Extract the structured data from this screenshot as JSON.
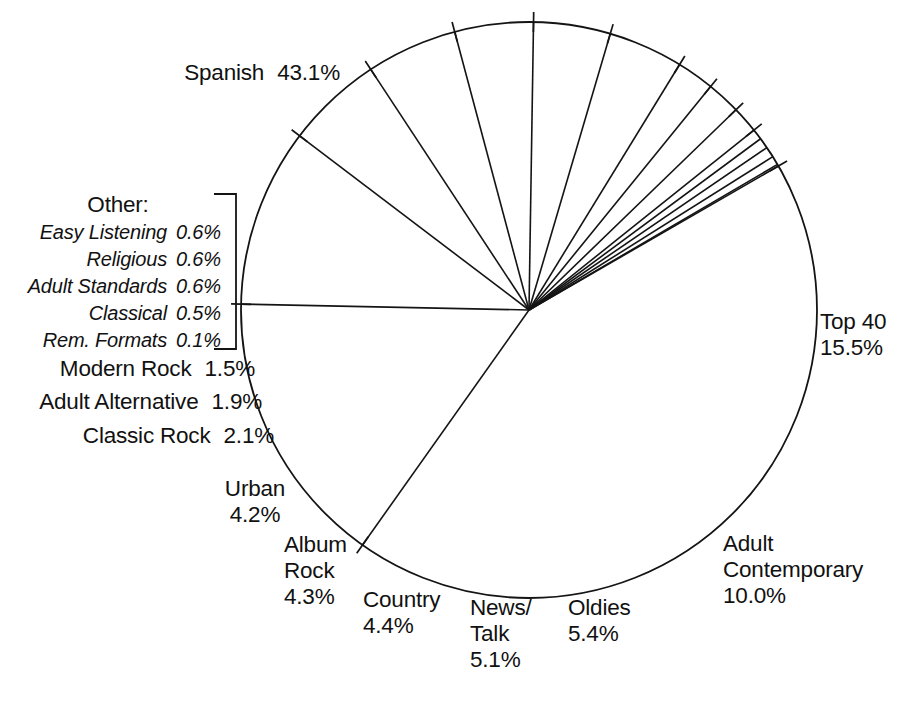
{
  "chart_data": {
    "type": "pie",
    "title": "",
    "total_pct": 100.0,
    "units": "percent of radio stations by format",
    "start_angle_deg": -30,
    "direction": "clockwise",
    "legend": "none",
    "grid": false,
    "categories": [
      "Spanish",
      "Top 40",
      "Adult Contemporary",
      "Oldies",
      "News/Talk",
      "Country",
      "Album Rock",
      "Urban",
      "Classic Rock",
      "Adult Alternative",
      "Modern Rock",
      "Easy Listening",
      "Religious",
      "Adult Standards",
      "Classical",
      "Rem. Formats"
    ],
    "values": [
      43.1,
      15.5,
      10.0,
      5.4,
      5.1,
      4.4,
      4.3,
      4.2,
      2.1,
      1.9,
      1.5,
      0.6,
      0.6,
      0.6,
      0.5,
      0.1
    ],
    "slices": [
      {
        "name": "Spanish",
        "value": 43.1,
        "label": "Spanish",
        "pct_text": "43.1%"
      },
      {
        "name": "Top 40",
        "value": 15.5,
        "label": "Top 40",
        "pct_text": "15.5%"
      },
      {
        "name": "Adult Contemporary",
        "value": 10.0,
        "label": "Adult Contemporary",
        "pct_text": "10.0%"
      },
      {
        "name": "Oldies",
        "value": 5.4,
        "label": "Oldies",
        "pct_text": "5.4%"
      },
      {
        "name": "News/Talk",
        "value": 5.1,
        "label": "News/Talk",
        "pct_text": "5.1%"
      },
      {
        "name": "Country",
        "value": 4.4,
        "label": "Country",
        "pct_text": "4.4%"
      },
      {
        "name": "Album Rock",
        "value": 4.3,
        "label": "Album Rock",
        "pct_text": "4.3%"
      },
      {
        "name": "Urban",
        "value": 4.2,
        "label": "Urban",
        "pct_text": "4.2%"
      },
      {
        "name": "Classic Rock",
        "value": 2.1,
        "label": "Classic Rock",
        "pct_text": "2.1%"
      },
      {
        "name": "Adult Alternative",
        "value": 1.9,
        "label": "Adult Alternative",
        "pct_text": "1.9%"
      },
      {
        "name": "Modern Rock",
        "value": 1.5,
        "label": "Modern Rock",
        "pct_text": "1.5%"
      },
      {
        "name": "Easy Listening",
        "value": 0.6,
        "label": "Easy Listening",
        "pct_text": "0.6%"
      },
      {
        "name": "Religious",
        "value": 0.6,
        "label": "Religious",
        "pct_text": "0.6%"
      },
      {
        "name": "Adult Standards",
        "value": 0.6,
        "label": "Adult Standards",
        "pct_text": "0.6%"
      },
      {
        "name": "Classical",
        "value": 0.5,
        "label": "Classical",
        "pct_text": "0.5%"
      },
      {
        "name": "Rem. Formats",
        "value": 0.1,
        "label": "Rem. Formats",
        "pct_text": "0.1%"
      }
    ],
    "colors": {
      "fill": "#ffffff",
      "stroke": "#141414",
      "text": "#111111",
      "background": "#ffffff"
    }
  },
  "labels": {
    "spanish": {
      "name": "Spanish",
      "pct": "43.1%"
    },
    "top40": {
      "name": "Top 40",
      "pct": "15.5%"
    },
    "adult_contemporary": {
      "name_line1": "Adult",
      "name_line2": "Contemporary",
      "pct": "10.0%"
    },
    "oldies": {
      "name": "Oldies",
      "pct": "5.4%"
    },
    "news_talk": {
      "name_line1": "News/",
      "name_line2": "Talk",
      "pct": "5.1%"
    },
    "country": {
      "name": "Country",
      "pct": "4.4%"
    },
    "album_rock": {
      "name_line1": "Album",
      "name_line2": "Rock",
      "pct": "4.3%"
    },
    "urban": {
      "name": "Urban",
      "pct": "4.2%"
    },
    "classic_rock": {
      "name": "Classic Rock",
      "pct": "2.1%"
    },
    "adult_alternative": {
      "name": "Adult Alternative",
      "pct": "1.9%"
    },
    "modern_rock": {
      "name": "Modern Rock",
      "pct": "1.5%"
    }
  },
  "other_group": {
    "title": "Other:",
    "rows": [
      {
        "name": "Easy Listening",
        "pct": "0.6%"
      },
      {
        "name": "Religious",
        "pct": "0.6%"
      },
      {
        "name": "Adult Standards",
        "pct": "0.6%"
      },
      {
        "name": "Classical",
        "pct": "0.5%"
      },
      {
        "name": "Rem. Formats",
        "pct": "0.1%"
      }
    ]
  },
  "geometry": {
    "cx": 529,
    "cy": 310,
    "r": 288,
    "tick_inner": 10,
    "tick_outer": 10,
    "start_angle_deg": -30
  }
}
